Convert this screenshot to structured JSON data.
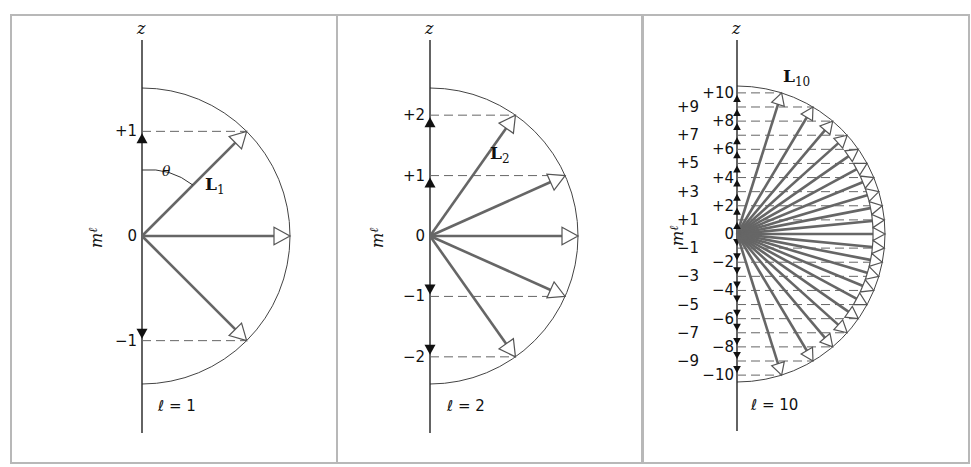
{
  "figure": {
    "frame_color": "#b8b8b8",
    "vector_color": "#666666",
    "panels": [
      {
        "id": "l1",
        "ell": 1,
        "axis_label": "z",
        "y_label": "m",
        "y_label_sub": "ℓ",
        "vector_label": "L",
        "vector_sub": "1",
        "ell_label": "ℓ = 1",
        "theta_label": "θ",
        "tick_labels": [
          "+1",
          "0",
          "−1"
        ],
        "m_values": [
          1,
          0,
          -1
        ]
      },
      {
        "id": "l2",
        "ell": 2,
        "axis_label": "z",
        "y_label": "m",
        "y_label_sub": "ℓ",
        "vector_label": "L",
        "vector_sub": "2",
        "ell_label": "ℓ = 2",
        "tick_labels": [
          "+2",
          "+1",
          "0",
          "−1",
          "−2"
        ],
        "m_values": [
          2,
          1,
          0,
          -1,
          -2
        ]
      },
      {
        "id": "l10",
        "ell": 10,
        "axis_label": "z",
        "y_label": "m",
        "y_label_sub": "ℓ",
        "vector_label": "L",
        "vector_sub": "10",
        "ell_label": "ℓ = 10",
        "tick_labels": [
          "+10",
          "+9",
          "+8",
          "+7",
          "+6",
          "+5",
          "+4",
          "+3",
          "+2",
          "+1",
          "0",
          "−1",
          "−2",
          "−3",
          "−4",
          "−5",
          "−6",
          "−7",
          "−8",
          "−9",
          "−10"
        ],
        "m_values": [
          10,
          9,
          8,
          7,
          6,
          5,
          4,
          3,
          2,
          1,
          0,
          -1,
          -2,
          -3,
          -4,
          -5,
          -6,
          -7,
          -8,
          -9,
          -10
        ]
      }
    ]
  }
}
